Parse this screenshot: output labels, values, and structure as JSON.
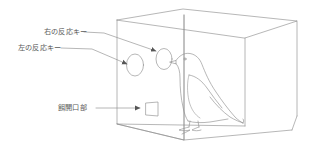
{
  "figure": {
    "type": "line-drawing",
    "background_color": "#ffffff",
    "line_color": "#8a8a8a",
    "text_color": "#5a5a5a",
    "canvas": {
      "width": 316,
      "height": 162
    }
  },
  "labels": {
    "right_key": "右の反応キー",
    "left_key": "左の反応キー",
    "feeder_opening": "餌開口部"
  },
  "parts": {
    "chamber": "実験箱",
    "right_response_key": "右の反応キー",
    "left_response_key": "左の反応キー",
    "feeder_aperture": "餌開口部",
    "pigeon": "ハト"
  },
  "leaders": [
    {
      "name": "right-key-leader",
      "from_label": "右の反応キー",
      "to_part": "right_response_key"
    },
    {
      "name": "left-key-leader",
      "from_label": "左の反応キー",
      "to_part": "left_response_key"
    },
    {
      "name": "feeder-leader",
      "from_label": "餌開口部",
      "to_part": "feeder_aperture"
    }
  ]
}
